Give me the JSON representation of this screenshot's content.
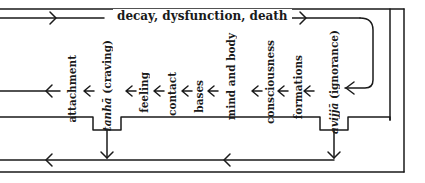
{
  "diagram": {
    "top_label": "decay, dysfunction, death",
    "links": [
      {
        "id": "attachment",
        "label": "attachment",
        "italic": ""
      },
      {
        "id": "tanha",
        "italic": "tanhā",
        "label": " (craving)"
      },
      {
        "id": "feeling",
        "label": "feeling",
        "italic": ""
      },
      {
        "id": "contact",
        "label": "contact",
        "italic": ""
      },
      {
        "id": "bases",
        "label": "bases",
        "italic": ""
      },
      {
        "id": "mind-and-body",
        "label": "mind and body",
        "italic": ""
      },
      {
        "id": "consciousness",
        "label": "consciousness",
        "italic": ""
      },
      {
        "id": "formations",
        "label": "formations",
        "italic": ""
      },
      {
        "id": "avijja",
        "italic": "avijjā",
        "label": " (ignorance)"
      }
    ],
    "colors": {
      "line": "#1a1a1a",
      "background": "#ffffff"
    }
  }
}
